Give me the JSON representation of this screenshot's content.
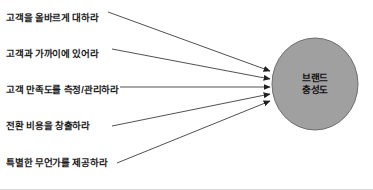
{
  "diagram": {
    "type": "convergent-arrow-diagram",
    "background_color": "#ffffff",
    "drivers": [
      {
        "label": "고객을 올바르게 대하라",
        "x": 6,
        "y": 13
      },
      {
        "label": "고객과 가까이에 있어라",
        "x": 6,
        "y": 49
      },
      {
        "label": "고객 만족도를 측정/관리하라",
        "x": 6,
        "y": 85
      },
      {
        "label": "전환 비용을 창출하라",
        "x": 6,
        "y": 121
      },
      {
        "label": "특별한 무언가를 제공하라",
        "x": 6,
        "y": 158
      }
    ],
    "arrows": [
      {
        "x1": 108,
        "y1": 12,
        "x2": 270,
        "y2": 71
      },
      {
        "x1": 112,
        "y1": 49,
        "x2": 270,
        "y2": 79
      },
      {
        "x1": 120,
        "y1": 87,
        "x2": 270,
        "y2": 87
      },
      {
        "x1": 112,
        "y1": 126,
        "x2": 270,
        "y2": 94
      },
      {
        "x1": 117,
        "y1": 163,
        "x2": 270,
        "y2": 101
      }
    ],
    "arrow_color": "#3d3d3d",
    "node": {
      "shape": "ellipse",
      "line1": "브랜드",
      "line2": "충성도",
      "fill_color": "#a0a0a0",
      "stroke_color": "#6e6e6e",
      "cx": 315,
      "cy": 84,
      "rx": 43,
      "ry": 46
    }
  }
}
